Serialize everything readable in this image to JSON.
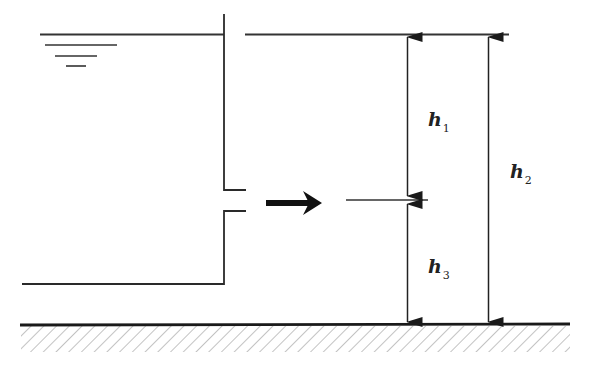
{
  "diagram": {
    "type": "orifice-flow-diagram",
    "colors": {
      "line": "#2a2a2a",
      "hatch": "#777777",
      "background": "#ffffff"
    },
    "labels": {
      "h1": {
        "main": "h",
        "sub": "1"
      },
      "h2": {
        "main": "h",
        "sub": "2"
      },
      "h3": {
        "main": "h",
        "sub": "3"
      }
    },
    "elements": [
      "water-surface-symbol",
      "tank-wall",
      "orifice",
      "flow-arrow",
      "jet-centerline",
      "downstream-surface",
      "ground"
    ]
  }
}
